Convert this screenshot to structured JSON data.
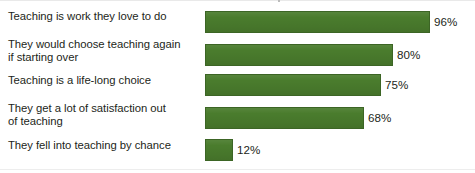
{
  "chart_data": {
    "type": "bar",
    "orientation": "horizontal",
    "title": "",
    "subtitle": "",
    "xlabel": "",
    "ylabel": "",
    "xlim": [
      0,
      100
    ],
    "grid": false,
    "legend": null,
    "value_suffix": "%",
    "series_color": "#4a7c2d",
    "categories": [
      "Teaching is work they love to do",
      "They would choose teaching again\nif starting over",
      "Teaching is a life-long choice",
      "They get a lot of satisfaction out\nof teaching",
      "They fell into teaching by chance"
    ],
    "values": [
      96,
      80,
      75,
      68,
      12
    ],
    "value_labels": [
      "96%",
      "80%",
      "75%",
      "68%",
      "12%"
    ]
  },
  "rows": [
    {
      "label": "Teaching is work they love to do",
      "value_label": "96%",
      "value": 96
    },
    {
      "label": "They would choose teaching again\nif starting over",
      "value_label": "80%",
      "value": 80
    },
    {
      "label": "Teaching is a life-long choice",
      "value_label": "75%",
      "value": 75
    },
    {
      "label": "They get a lot of satisfaction out\nof teaching",
      "value_label": "68%",
      "value": 68
    },
    {
      "label": "They fell into teaching by chance",
      "value_label": "12%",
      "value": 12
    }
  ]
}
